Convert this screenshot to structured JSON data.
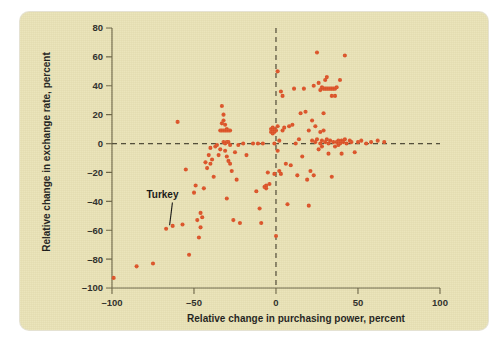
{
  "figure": {
    "background_color": "#ffffff",
    "panel_color": "#e9e2b6",
    "marker_color": "#dd5226",
    "axis_color": "#6d6646"
  },
  "chart_data": {
    "type": "scatter",
    "title": "",
    "xlabel": "Relative change in purchasing power, percent",
    "ylabel": "Relative change in exchange rate, percent",
    "xlim": [
      -100,
      100
    ],
    "ylim": [
      -100,
      80
    ],
    "xticks": [
      -100,
      -50,
      0,
      50,
      100
    ],
    "yticks": [
      -100,
      -80,
      -60,
      -40,
      -20,
      0,
      20,
      40,
      60,
      80
    ],
    "xtick_labels": [
      "–100",
      "–50",
      "0",
      "50",
      "100"
    ],
    "ytick_labels": [
      "–100",
      "–80",
      "–60",
      "–40",
      "–20",
      "0",
      "20",
      "40",
      "60",
      "80"
    ],
    "grid": false,
    "legend": null,
    "reference_lines": [
      {
        "orientation": "vertical",
        "value": 0,
        "style": "dashed"
      },
      {
        "orientation": "horizontal",
        "value": 0,
        "style": "dashed"
      }
    ],
    "annotations": [
      {
        "text": "Turkey",
        "label_x": -79,
        "label_y": -38,
        "point_x": -67,
        "point_y": -59
      }
    ],
    "series": [
      {
        "name": "countries",
        "marker": "circle",
        "color": "#dd5226",
        "points": [
          [
            -99,
            -93
          ],
          [
            -85,
            -85
          ],
          [
            -75,
            -83
          ],
          [
            -67,
            -59
          ],
          [
            -63,
            -57
          ],
          [
            -60,
            15
          ],
          [
            -57,
            -56
          ],
          [
            -55,
            -18
          ],
          [
            -53,
            -77
          ],
          [
            -50,
            -34
          ],
          [
            -49,
            -29
          ],
          [
            -48,
            -53
          ],
          [
            -47,
            -65
          ],
          [
            -46,
            -48
          ],
          [
            -46,
            -58
          ],
          [
            -45,
            -51
          ],
          [
            -44,
            -31
          ],
          [
            -43,
            -13
          ],
          [
            -42,
            -17
          ],
          [
            -41,
            -8
          ],
          [
            -40,
            -3
          ],
          [
            -40,
            -14
          ],
          [
            -39,
            -11
          ],
          [
            -38,
            -23
          ],
          [
            -37,
            -2
          ],
          [
            -36,
            -1
          ],
          [
            -35,
            -8
          ],
          [
            -34,
            9
          ],
          [
            -34,
            -4
          ],
          [
            -33,
            9
          ],
          [
            -33,
            14
          ],
          [
            -33,
            26
          ],
          [
            -32,
            9
          ],
          [
            -32,
            16
          ],
          [
            -32,
            20
          ],
          [
            -32,
            1
          ],
          [
            -31,
            9
          ],
          [
            -31,
            13
          ],
          [
            -31,
            0
          ],
          [
            -31,
            -5
          ],
          [
            -30,
            9
          ],
          [
            -30,
            10
          ],
          [
            -30,
            1
          ],
          [
            -30,
            -9
          ],
          [
            -30,
            -38
          ],
          [
            -29,
            9
          ],
          [
            -29,
            1
          ],
          [
            -29,
            -12
          ],
          [
            -28,
            9
          ],
          [
            -28,
            -1
          ],
          [
            -28,
            -14
          ],
          [
            -27,
            -19
          ],
          [
            -26,
            -53
          ],
          [
            -25,
            -6
          ],
          [
            -24,
            -25
          ],
          [
            -23,
            -1
          ],
          [
            -22,
            -55
          ],
          [
            -20,
            0
          ],
          [
            -18,
            -8
          ],
          [
            -14,
            0
          ],
          [
            -12,
            -33
          ],
          [
            -11,
            0
          ],
          [
            -10,
            -45
          ],
          [
            -9,
            -55
          ],
          [
            -8,
            0
          ],
          [
            -7,
            -30
          ],
          [
            -6,
            -29
          ],
          [
            -6,
            -31
          ],
          [
            -5,
            -20
          ],
          [
            -4,
            -28
          ],
          [
            -3,
            8
          ],
          [
            -3,
            10
          ],
          [
            -2,
            7
          ],
          [
            -2,
            9
          ],
          [
            -2,
            11
          ],
          [
            -1,
            8
          ],
          [
            -1,
            10
          ],
          [
            -1,
            0
          ],
          [
            -1,
            -21
          ],
          [
            0,
            9
          ],
          [
            0,
            -64
          ],
          [
            1,
            12
          ],
          [
            1,
            50
          ],
          [
            1,
            -5
          ],
          [
            2,
            2
          ],
          [
            2,
            -19
          ],
          [
            3,
            36
          ],
          [
            3,
            -21
          ],
          [
            4,
            33
          ],
          [
            4,
            9
          ],
          [
            5,
            11
          ],
          [
            6,
            -14
          ],
          [
            7,
            -42
          ],
          [
            8,
            12
          ],
          [
            9,
            -15
          ],
          [
            10,
            13
          ],
          [
            11,
            38
          ],
          [
            12,
            0
          ],
          [
            13,
            -22
          ],
          [
            14,
            3
          ],
          [
            15,
            21
          ],
          [
            16,
            -9
          ],
          [
            17,
            38
          ],
          [
            18,
            22
          ],
          [
            19,
            -25
          ],
          [
            20,
            -43
          ],
          [
            20,
            9
          ],
          [
            21,
            -19
          ],
          [
            22,
            2
          ],
          [
            22,
            16
          ],
          [
            23,
            -22
          ],
          [
            23,
            40
          ],
          [
            24,
            1
          ],
          [
            24,
            12
          ],
          [
            25,
            3
          ],
          [
            25,
            63
          ],
          [
            26,
            -4
          ],
          [
            26,
            42
          ],
          [
            27,
            37
          ],
          [
            27,
            0
          ],
          [
            27,
            8
          ],
          [
            28,
            39
          ],
          [
            28,
            2
          ],
          [
            28,
            -2
          ],
          [
            29,
            38
          ],
          [
            29,
            21
          ],
          [
            29,
            9
          ],
          [
            30,
            38
          ],
          [
            30,
            1
          ],
          [
            30,
            44
          ],
          [
            31,
            38
          ],
          [
            31,
            46
          ],
          [
            31,
            3
          ],
          [
            32,
            38
          ],
          [
            32,
            0
          ],
          [
            32,
            -7
          ],
          [
            33,
            38
          ],
          [
            33,
            2
          ],
          [
            34,
            38
          ],
          [
            34,
            33
          ],
          [
            34,
            -23
          ],
          [
            35,
            38
          ],
          [
            35,
            1
          ],
          [
            36,
            38
          ],
          [
            36,
            33
          ],
          [
            36,
            -2
          ],
          [
            37,
            39
          ],
          [
            37,
            1
          ],
          [
            38,
            2
          ],
          [
            38,
            -1
          ],
          [
            39,
            44
          ],
          [
            39,
            0
          ],
          [
            40,
            2
          ],
          [
            40,
            -7
          ],
          [
            41,
            1
          ],
          [
            42,
            61
          ],
          [
            42,
            3
          ],
          [
            43,
            0
          ],
          [
            45,
            2
          ],
          [
            46,
            1
          ],
          [
            48,
            -6
          ],
          [
            50,
            1
          ],
          [
            52,
            2
          ],
          [
            55,
            0
          ],
          [
            58,
            1
          ],
          [
            62,
            2
          ],
          [
            66,
            1
          ]
        ]
      }
    ]
  }
}
